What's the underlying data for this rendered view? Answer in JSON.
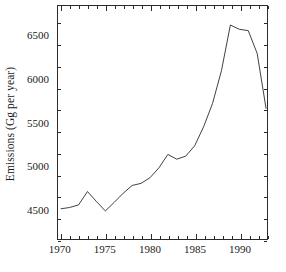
{
  "chart_data": {
    "type": "line",
    "title": "",
    "xlabel": "",
    "ylabel": "Emissions (Gg per year)",
    "xlim": [
      1969.7,
      1993.1
    ],
    "ylim": [
      4150,
      6850
    ],
    "grid": false,
    "legend": "none",
    "xticks": [
      1970,
      1975,
      1980,
      1985,
      1990
    ],
    "xtick_labels": [
      "1970",
      "1975",
      "1980",
      "1985",
      "1990"
    ],
    "xminor_step": 1,
    "yticks": [
      4500,
      5000,
      5500,
      6000,
      6500
    ],
    "ytick_labels": [
      "4500",
      "5000",
      "5500",
      "6000",
      "6500"
    ],
    "yminor_step": 250,
    "line_color": "#2b2b2b",
    "line_width": 0.9,
    "x": [
      1970,
      1971,
      1972,
      1973,
      1974,
      1975,
      1976,
      1977,
      1978,
      1979,
      1980,
      1981,
      1982,
      1983,
      1984,
      1985,
      1986,
      1987,
      1988,
      1989,
      1990,
      1991,
      1992,
      1993
    ],
    "values": [
      4500,
      4515,
      4545,
      4700,
      4585,
      4475,
      4575,
      4680,
      4770,
      4795,
      4860,
      4975,
      5130,
      5075,
      5110,
      5230,
      5450,
      5720,
      6100,
      6630,
      6580,
      6565,
      6300,
      5660
    ],
    "series": [
      {
        "name": "Emissions",
        "values": [
          4500,
          4515,
          4545,
          4700,
          4585,
          4475,
          4575,
          4680,
          4770,
          4795,
          4860,
          4975,
          5130,
          5075,
          5110,
          5230,
          5450,
          5720,
          6100,
          6630,
          6580,
          6565,
          6300,
          5660
        ]
      }
    ]
  }
}
